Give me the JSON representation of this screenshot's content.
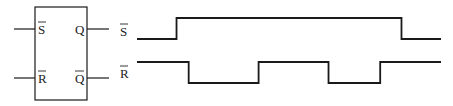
{
  "latch_block": {
    "inputs": [
      {
        "label": "S",
        "overbar": true
      },
      {
        "label": "R",
        "overbar": true
      }
    ],
    "outputs": [
      {
        "label": "Q",
        "overbar": false
      },
      {
        "label": "Q",
        "overbar": true
      }
    ]
  },
  "timing_diagram": {
    "time_range": [
      0,
      100
    ],
    "signals": [
      {
        "name": "S",
        "overbar": true,
        "initial": 0,
        "transitions": [
          {
            "t": 13,
            "level": 1
          },
          {
            "t": 87,
            "level": 0
          }
        ]
      },
      {
        "name": "R",
        "overbar": true,
        "initial": 1,
        "transitions": [
          {
            "t": 17,
            "level": 0
          },
          {
            "t": 40,
            "level": 1
          },
          {
            "t": 63,
            "level": 0
          },
          {
            "t": 80,
            "level": 1
          }
        ]
      }
    ]
  }
}
